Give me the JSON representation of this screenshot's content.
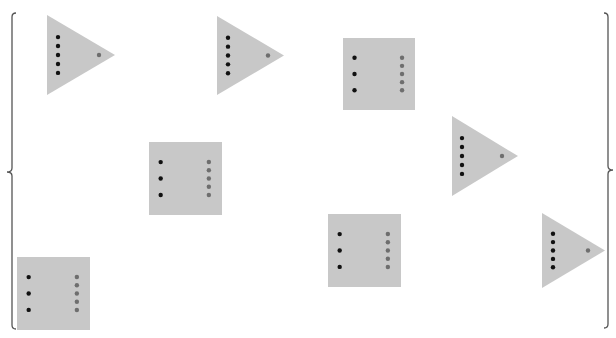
{
  "canvas": {
    "width": 616,
    "height": 338,
    "background": "#ffffff"
  },
  "colors": {
    "shape_fill": "#c8c8c8",
    "black_dot": "#111111",
    "gray_dot": "#6e6e6e",
    "brace": "#555555"
  },
  "braces": {
    "left": {
      "x": 12,
      "top": 13,
      "bottom": 329,
      "mid": 172,
      "direction": "left"
    },
    "right": {
      "x": 608,
      "top": 13,
      "bottom": 328,
      "mid": 170,
      "direction": "right"
    }
  },
  "triangles": [
    {
      "left": 47,
      "top": 15,
      "bottom": 95,
      "tip_x": 115,
      "black_dots_x": 58,
      "gray_dot_x": 99
    },
    {
      "left": 217,
      "top": 16,
      "bottom": 95,
      "tip_x": 284,
      "black_dots_x": 228,
      "gray_dot_x": 268
    },
    {
      "left": 452,
      "top": 116,
      "bottom": 196,
      "tip_x": 518,
      "black_dots_x": 462,
      "gray_dot_x": 502
    },
    {
      "left": 542,
      "top": 213,
      "bottom": 288,
      "tip_x": 605,
      "black_dots_x": 553,
      "gray_dot_x": 588
    }
  ],
  "squares": [
    {
      "left": 343,
      "top": 38,
      "size": 72
    },
    {
      "left": 149,
      "top": 142,
      "size": 73
    },
    {
      "left": 328,
      "top": 214,
      "size": 73
    },
    {
      "left": 17,
      "top": 257,
      "size": 73
    }
  ],
  "shape_counts": {
    "triangles": 4,
    "squares": 4
  }
}
